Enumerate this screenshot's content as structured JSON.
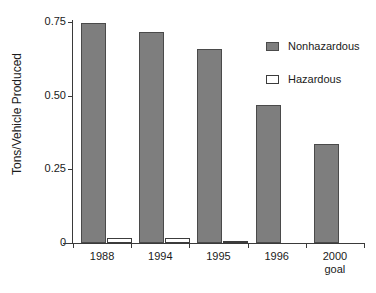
{
  "chart_data": {
    "type": "bar",
    "title": "",
    "xlabel": "",
    "ylabel": "Tons/Vehicle Produced",
    "categories": [
      "1988",
      "1994",
      "1995",
      "1996",
      "2000\ngoal"
    ],
    "series": [
      {
        "name": "Nonhazardous",
        "values": [
          0.745,
          0.715,
          0.66,
          0.47,
          0.335
        ],
        "color": "#7e7e7e"
      },
      {
        "name": "Hazardous",
        "values": [
          0.017,
          0.017,
          0.008,
          0,
          0
        ],
        "color": "#ffffff"
      }
    ],
    "ylim": [
      0,
      0.75
    ],
    "yticks": [
      "0",
      "0.25",
      "0.50",
      "0.75"
    ],
    "ytick_values": [
      0,
      0.25,
      0.5,
      0.75
    ],
    "grid": false,
    "legend_position": "right"
  },
  "legend": {
    "entries": [
      {
        "label": "Nonhazardous",
        "swatch": "filled-square"
      },
      {
        "label": "Hazardous",
        "swatch": "hollow-square"
      }
    ]
  }
}
